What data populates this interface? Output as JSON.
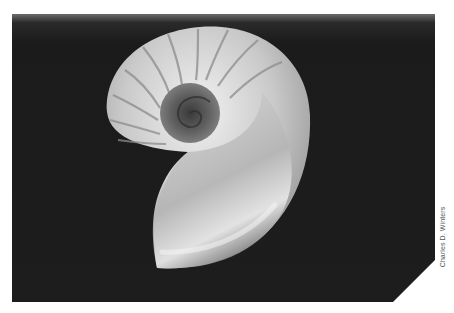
{
  "figure": {
    "alt": "Cross-section of a chambered nautilus shell on a black background",
    "credit": "Charles D. Winters",
    "colors": {
      "background": "#1a1a1a",
      "shell_light": "#e6e6e6",
      "shell_mid": "#a8a8a8",
      "shell_dark": "#5a5a5a",
      "page": "#ffffff"
    }
  }
}
